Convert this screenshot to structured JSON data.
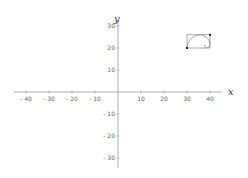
{
  "chart_data": {
    "type": "scatter",
    "title": "",
    "xlabel": "x",
    "ylabel": "y",
    "xlim": [
      -45,
      45
    ],
    "ylim": [
      -35,
      33
    ],
    "grid": false,
    "x_ticks": [
      -40,
      -30,
      -20,
      -10,
      10,
      20,
      30,
      40
    ],
    "y_ticks": [
      30,
      20,
      10,
      -10,
      -20,
      -30
    ],
    "x_tick_labels": [
      "- 40",
      "- 30",
      "- 20",
      "- 10",
      "10",
      "20",
      "30",
      "40"
    ],
    "y_tick_labels": [
      "30",
      "20",
      "10",
      "- 10",
      "- 20",
      "- 30"
    ],
    "shapes": [
      {
        "type": "rectangle",
        "x0": 30,
        "y0": 20,
        "x1": 40,
        "y1": 26
      },
      {
        "type": "spiral",
        "description": "golden spiral inscribed in rectangle"
      }
    ],
    "points": [
      {
        "x": 30,
        "y": 20
      },
      {
        "x": 40,
        "y": 26
      }
    ]
  },
  "colors": {
    "axis": "#999999",
    "text": "#666666",
    "shape": "#777777",
    "point": "#222222"
  }
}
